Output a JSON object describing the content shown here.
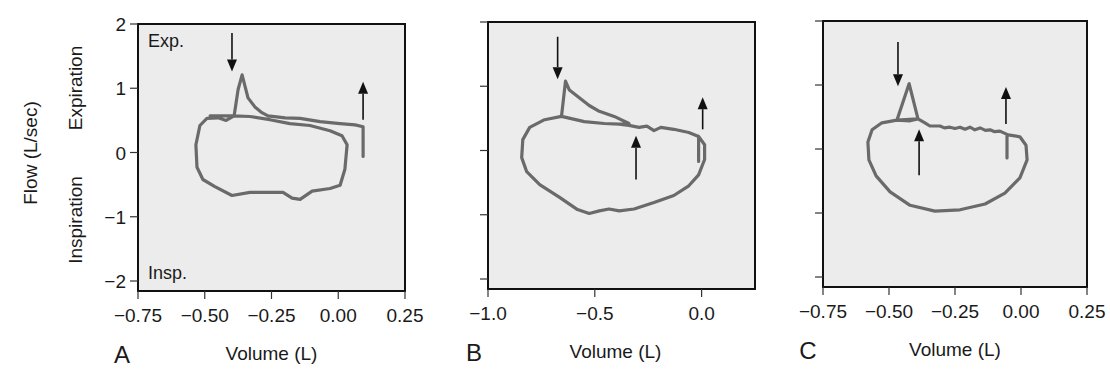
{
  "chart_data": [
    {
      "type": "line",
      "panel": "A",
      "xlabel": "Volume (L)",
      "ylabel": "Flow (L/sec)",
      "ylabel_upper": "Expiration",
      "ylabel_lower": "Inspiration",
      "annot_top": "Exp.",
      "annot_bottom": "Insp.",
      "xlim": [
        -0.75,
        0.25
      ],
      "ylim": [
        -2,
        2
      ],
      "xticks": [
        -0.75,
        -0.5,
        -0.25,
        0.0,
        0.25
      ],
      "xtick_labels": [
        "−0.75",
        "−0.50",
        "−0.25",
        "0.00",
        "0.25"
      ],
      "yticks": [
        2,
        1,
        0,
        -1,
        -2
      ],
      "ytick_labels": [
        "2",
        "1",
        "0",
        "−1",
        "−2"
      ],
      "show_yticklabels": true,
      "series": [
        {
          "name": "flow-volume loop",
          "points": [
            [
              0.093,
              -0.06
            ],
            [
              0.093,
              0.4
            ],
            [
              0.063,
              0.43
            ],
            [
              0.007,
              0.45
            ],
            [
              -0.068,
              0.48
            ],
            [
              -0.143,
              0.53
            ],
            [
              -0.199,
              0.54
            ],
            [
              -0.263,
              0.57
            ],
            [
              -0.286,
              0.62
            ],
            [
              -0.312,
              0.71
            ],
            [
              -0.338,
              0.85
            ],
            [
              -0.36,
              1.21
            ],
            [
              -0.375,
              0.98
            ],
            [
              -0.39,
              0.57
            ],
            [
              -0.42,
              0.5
            ],
            [
              -0.45,
              0.54
            ],
            [
              -0.492,
              0.53
            ],
            [
              -0.518,
              0.42
            ],
            [
              -0.533,
              0.12
            ],
            [
              -0.529,
              -0.23
            ],
            [
              -0.507,
              -0.42
            ],
            [
              -0.462,
              -0.53
            ],
            [
              -0.398,
              -0.67
            ],
            [
              -0.331,
              -0.62
            ],
            [
              -0.256,
              -0.62
            ],
            [
              -0.207,
              -0.62
            ],
            [
              -0.173,
              -0.71
            ],
            [
              -0.143,
              -0.73
            ],
            [
              -0.098,
              -0.6
            ],
            [
              -0.031,
              -0.56
            ],
            [
              0.007,
              -0.51
            ],
            [
              0.025,
              -0.26
            ],
            [
              0.033,
              0.12
            ],
            [
              0.014,
              0.26
            ],
            [
              -0.031,
              0.34
            ],
            [
              -0.106,
              0.42
            ],
            [
              -0.181,
              0.45
            ],
            [
              -0.256,
              0.51
            ],
            [
              -0.331,
              0.56
            ],
            [
              -0.39,
              0.57
            ],
            [
              -0.424,
              0.57
            ],
            [
              -0.48,
              0.57
            ]
          ]
        }
      ],
      "arrows": [
        {
          "direction": "down",
          "x": -0.398,
          "y_from": 1.86,
          "y_to": 1.26
        },
        {
          "direction": "up",
          "x": 0.093,
          "y_from": 0.51,
          "y_to": 1.1
        }
      ]
    },
    {
      "type": "line",
      "panel": "B",
      "xlabel": "Volume (L)",
      "xlim": [
        -1.0,
        0.25
      ],
      "ylim": [
        -2,
        2
      ],
      "xticks": [
        -1.0,
        -0.5,
        0.0
      ],
      "xtick_labels": [
        "−1.0",
        "−0.5",
        "0.0"
      ],
      "yticks": [
        2,
        1,
        0,
        -1,
        -2
      ],
      "show_yticklabels": false,
      "series": [
        {
          "name": "flow-volume loop",
          "points": [
            [
              -0.014,
              -0.17
            ],
            [
              -0.014,
              0.22
            ],
            [
              -0.06,
              0.28
            ],
            [
              -0.13,
              0.33
            ],
            [
              -0.191,
              0.36
            ],
            [
              -0.223,
              0.31
            ],
            [
              -0.256,
              0.38
            ],
            [
              -0.293,
              0.36
            ],
            [
              -0.34,
              0.39
            ],
            [
              -0.386,
              0.41
            ],
            [
              -0.456,
              0.42
            ],
            [
              -0.549,
              0.45
            ],
            [
              -0.656,
              0.53
            ],
            [
              -0.637,
              1.08
            ],
            [
              -0.619,
              0.94
            ],
            [
              -0.526,
              0.7
            ],
            [
              -0.479,
              0.61
            ],
            [
              -0.409,
              0.53
            ],
            [
              -0.34,
              0.42
            ],
            [
              -0.386,
              0.41
            ],
            [
              -0.456,
              0.42
            ],
            [
              -0.549,
              0.45
            ],
            [
              -0.656,
              0.53
            ],
            [
              -0.735,
              0.48
            ],
            [
              -0.805,
              0.36
            ],
            [
              -0.837,
              0.17
            ],
            [
              -0.842,
              -0.11
            ],
            [
              -0.819,
              -0.33
            ],
            [
              -0.758,
              -0.53
            ],
            [
              -0.665,
              -0.73
            ],
            [
              -0.581,
              -0.92
            ],
            [
              -0.526,
              -0.98
            ],
            [
              -0.479,
              -0.94
            ],
            [
              -0.433,
              -0.91
            ],
            [
              -0.386,
              -0.94
            ],
            [
              -0.316,
              -0.91
            ],
            [
              -0.223,
              -0.81
            ],
            [
              -0.13,
              -0.7
            ],
            [
              -0.06,
              -0.55
            ],
            [
              -0.014,
              -0.38
            ],
            [
              0.014,
              -0.14
            ],
            [
              0.014,
              0.09
            ],
            [
              -0.014,
              0.22
            ]
          ]
        }
      ],
      "arrows": [
        {
          "direction": "down",
          "x": -0.674,
          "y_from": 1.77,
          "y_to": 1.11
        },
        {
          "direction": "up",
          "x": -0.307,
          "y_from": -0.45,
          "y_to": 0.23
        },
        {
          "direction": "up",
          "x": 0.005,
          "y_from": 0.33,
          "y_to": 0.83
        }
      ]
    },
    {
      "type": "line",
      "panel": "C",
      "xlabel": "Volume (L)",
      "xlim": [
        -0.75,
        0.25
      ],
      "ylim": [
        -2,
        2
      ],
      "xticks": [
        -0.75,
        -0.5,
        -0.25,
        0.0,
        0.25
      ],
      "xtick_labels": [
        "−0.75",
        "−0.50",
        "−0.25",
        "0.00",
        "0.25"
      ],
      "yticks": [
        2,
        1,
        0,
        -1,
        -2
      ],
      "show_yticklabels": false,
      "series": [
        {
          "name": "flow-volume loop",
          "points": [
            [
              -0.053,
              -0.14
            ],
            [
              -0.053,
              0.2
            ],
            [
              -0.049,
              0.22
            ],
            [
              -0.08,
              0.28
            ],
            [
              -0.1,
              0.27
            ],
            [
              -0.117,
              0.3
            ],
            [
              -0.135,
              0.29
            ],
            [
              -0.155,
              0.33
            ],
            [
              -0.175,
              0.3
            ],
            [
              -0.193,
              0.34
            ],
            [
              -0.212,
              0.31
            ],
            [
              -0.231,
              0.34
            ],
            [
              -0.25,
              0.32
            ],
            [
              -0.269,
              0.34
            ],
            [
              -0.29,
              0.33
            ],
            [
              -0.307,
              0.36
            ],
            [
              -0.345,
              0.36
            ],
            [
              -0.364,
              0.41
            ],
            [
              -0.39,
              0.47
            ],
            [
              -0.424,
              1.02
            ],
            [
              -0.47,
              0.45
            ],
            [
              -0.42,
              0.44
            ],
            [
              -0.39,
              0.47
            ],
            [
              -0.47,
              0.45
            ],
            [
              -0.527,
              0.41
            ],
            [
              -0.564,
              0.3
            ],
            [
              -0.58,
              0.11
            ],
            [
              -0.576,
              -0.17
            ],
            [
              -0.549,
              -0.42
            ],
            [
              -0.496,
              -0.67
            ],
            [
              -0.42,
              -0.88
            ],
            [
              -0.326,
              -0.97
            ],
            [
              -0.231,
              -0.95
            ],
            [
              -0.136,
              -0.86
            ],
            [
              -0.061,
              -0.69
            ],
            [
              -0.004,
              -0.45
            ],
            [
              0.023,
              -0.17
            ],
            [
              0.019,
              0.06
            ],
            [
              -0.004,
              0.19
            ],
            [
              -0.049,
              0.22
            ]
          ]
        }
      ],
      "arrows": [
        {
          "direction": "down",
          "x": -0.466,
          "y_from": 1.67,
          "y_to": 0.98
        },
        {
          "direction": "up",
          "x": -0.386,
          "y_from": -0.41,
          "y_to": 0.31
        },
        {
          "direction": "up",
          "x": -0.057,
          "y_from": 0.39,
          "y_to": 0.97
        }
      ]
    }
  ]
}
